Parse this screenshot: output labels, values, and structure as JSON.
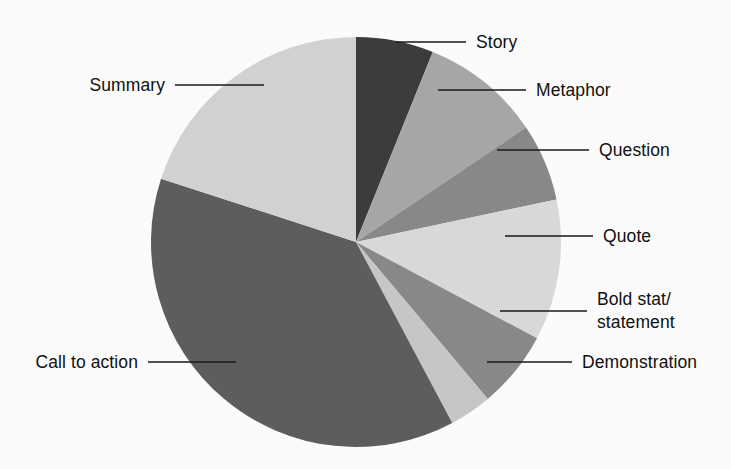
{
  "chart_data": {
    "type": "pie",
    "title": "",
    "subtitle": "",
    "xlabel": "",
    "ylabel": "",
    "grid": false,
    "legend_position": "callout-labels",
    "start_angle_deg": 0,
    "direction": "clockwise",
    "center": {
      "x": 356,
      "y": 242
    },
    "radius": 205,
    "categories": [
      "Story",
      "Metaphor",
      "Question",
      "Quote",
      "Bold stat/ statement",
      "Demonstration",
      "Call to action",
      "Summary"
    ],
    "values": [
      6.1,
      9.4,
      6.1,
      11.1,
      6.1,
      3.3,
      37.8,
      20.0
    ],
    "colors": [
      "#3d3d3d",
      "#a9a9a9",
      "#8b8b8b",
      "#dcdcdc",
      "#8b8b8b",
      "#c9c9c9",
      "#5f5f5f",
      "#d5d5d5"
    ],
    "units": "percent"
  },
  "pie": {
    "background_color": "#ffffff",
    "label_color": "#111111",
    "leader_color": "#1a1a1a",
    "slices": [
      {
        "name": "Story",
        "label": "Story",
        "label_line2": "",
        "value": 6.1,
        "start_deg": 0,
        "end_deg": 22,
        "color": "#3d3d3d",
        "leader": {
          "x1": 396,
          "y1": 42,
          "x2": 466,
          "y2": 42
        },
        "text": {
          "x": 476,
          "y": 48,
          "anchor": "start"
        }
      },
      {
        "name": "Metaphor",
        "label": "Metaphor",
        "label_line2": "",
        "value": 9.4,
        "start_deg": 22,
        "end_deg": 56,
        "color": "#a9a9a9",
        "leader": {
          "x1": 438,
          "y1": 90,
          "x2": 526,
          "y2": 90
        },
        "text": {
          "x": 536,
          "y": 96,
          "anchor": "start"
        }
      },
      {
        "name": "Question",
        "label": "Question",
        "label_line2": "",
        "value": 6.1,
        "start_deg": 56,
        "end_deg": 78,
        "color": "#8b8b8b",
        "leader": {
          "x1": 497,
          "y1": 150,
          "x2": 589,
          "y2": 150
        },
        "text": {
          "x": 599,
          "y": 156,
          "anchor": "start"
        }
      },
      {
        "name": "Quote",
        "label": "Quote",
        "label_line2": "",
        "value": 11.1,
        "start_deg": 78,
        "end_deg": 118,
        "color": "#dcdcdc",
        "leader": {
          "x1": 505,
          "y1": 236,
          "x2": 593,
          "y2": 236
        },
        "text": {
          "x": 603,
          "y": 242,
          "anchor": "start"
        }
      },
      {
        "name": "Bold stat/ statement",
        "label": "Bold stat/",
        "label_line2": "statement",
        "value": 6.1,
        "start_deg": 118,
        "end_deg": 140,
        "color": "#8b8b8b",
        "leader": {
          "x1": 500,
          "y1": 311,
          "x2": 587,
          "y2": 311
        },
        "text": {
          "x": 597,
          "y": 305,
          "anchor": "start"
        }
      },
      {
        "name": "Demonstration",
        "label": "Demonstration",
        "label_line2": "",
        "value": 3.3,
        "start_deg": 140,
        "end_deg": 152,
        "color": "#c9c9c9",
        "leader": {
          "x1": 487,
          "y1": 362,
          "x2": 572,
          "y2": 362
        },
        "text": {
          "x": 582,
          "y": 368,
          "anchor": "start"
        }
      },
      {
        "name": "Call to action",
        "label": "Call to action",
        "label_line2": "",
        "value": 37.8,
        "start_deg": 152,
        "end_deg": 288,
        "color": "#5f5f5f",
        "leader": {
          "x1": 148,
          "y1": 362,
          "x2": 236,
          "y2": 362
        },
        "text": {
          "x": 138,
          "y": 368,
          "anchor": "end"
        }
      },
      {
        "name": "Summary",
        "label": "Summary",
        "label_line2": "",
        "value": 20.0,
        "start_deg": 288,
        "end_deg": 360,
        "color": "#d5d5d5",
        "leader": {
          "x1": 175,
          "y1": 85,
          "x2": 264,
          "y2": 85
        },
        "text": {
          "x": 165,
          "y": 91,
          "anchor": "end"
        }
      }
    ]
  }
}
